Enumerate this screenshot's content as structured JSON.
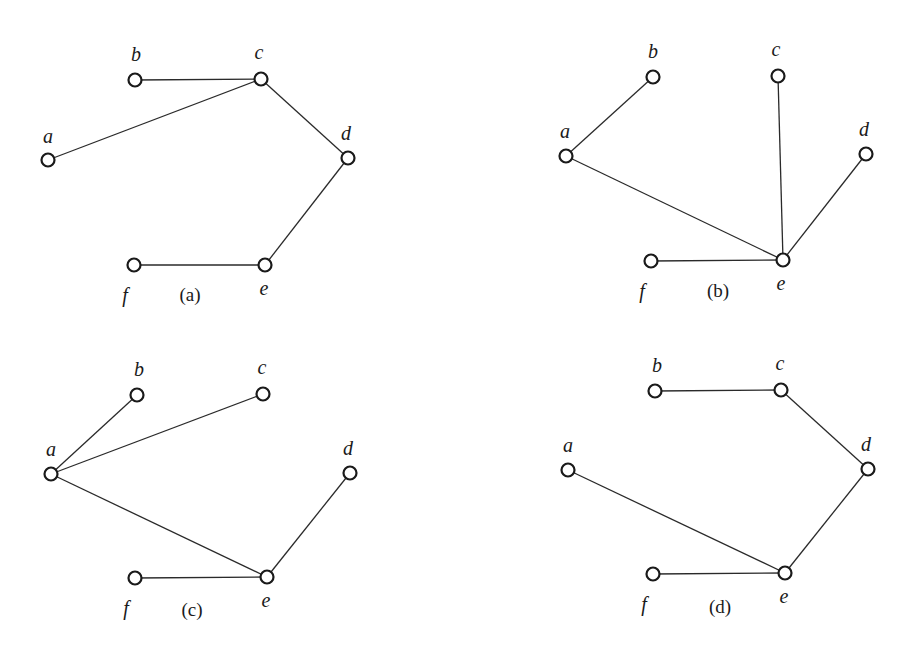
{
  "diagram": {
    "node_color": "#1a1a1a",
    "edge_color": "#2a2a2a",
    "background": "#ffffff",
    "panels": [
      {
        "caption": "(a)",
        "caption_pos": [
          190,
          301
        ],
        "nodes": [
          {
            "id": "a",
            "label": "a",
            "x": 48,
            "y": 160,
            "lx": 48,
            "ly": 143
          },
          {
            "id": "b",
            "label": "b",
            "x": 135,
            "y": 80,
            "lx": 136,
            "ly": 61
          },
          {
            "id": "c",
            "label": "c",
            "x": 261,
            "y": 79,
            "lx": 259,
            "ly": 59
          },
          {
            "id": "d",
            "label": "d",
            "x": 348,
            "y": 158,
            "lx": 346,
            "ly": 140
          },
          {
            "id": "e",
            "label": "e",
            "x": 265,
            "y": 265,
            "lx": 264,
            "ly": 295
          },
          {
            "id": "f",
            "label": "f",
            "x": 134,
            "y": 265,
            "lx": 125,
            "ly": 302
          }
        ],
        "edges": [
          [
            "b",
            "c"
          ],
          [
            "a",
            "c"
          ],
          [
            "c",
            "d"
          ],
          [
            "d",
            "e"
          ],
          [
            "f",
            "e"
          ]
        ]
      },
      {
        "caption": "(b)",
        "caption_pos": [
          718,
          297
        ],
        "nodes": [
          {
            "id": "a",
            "label": "a",
            "x": 566,
            "y": 156,
            "lx": 565,
            "ly": 138
          },
          {
            "id": "b",
            "label": "b",
            "x": 653,
            "y": 77,
            "lx": 653,
            "ly": 58
          },
          {
            "id": "c",
            "label": "c",
            "x": 778,
            "y": 76,
            "lx": 776,
            "ly": 56
          },
          {
            "id": "d",
            "label": "d",
            "x": 866,
            "y": 154,
            "lx": 864,
            "ly": 136
          },
          {
            "id": "e",
            "label": "e",
            "x": 783,
            "y": 260,
            "lx": 781,
            "ly": 290
          },
          {
            "id": "f",
            "label": "f",
            "x": 651,
            "y": 261,
            "lx": 642,
            "ly": 298
          }
        ],
        "edges": [
          [
            "a",
            "b"
          ],
          [
            "a",
            "e"
          ],
          [
            "c",
            "e"
          ],
          [
            "d",
            "e"
          ],
          [
            "f",
            "e"
          ]
        ]
      },
      {
        "caption": "(c)",
        "caption_pos": [
          192,
          616
        ],
        "nodes": [
          {
            "id": "a",
            "label": "a",
            "x": 51,
            "y": 474,
            "lx": 51,
            "ly": 456
          },
          {
            "id": "b",
            "label": "b",
            "x": 137,
            "y": 395,
            "lx": 139,
            "ly": 376
          },
          {
            "id": "c",
            "label": "c",
            "x": 263,
            "y": 394,
            "lx": 262,
            "ly": 374
          },
          {
            "id": "d",
            "label": "d",
            "x": 350,
            "y": 473,
            "lx": 348,
            "ly": 455
          },
          {
            "id": "e",
            "label": "e",
            "x": 267,
            "y": 577,
            "lx": 266,
            "ly": 607
          },
          {
            "id": "f",
            "label": "f",
            "x": 135,
            "y": 578,
            "lx": 126,
            "ly": 615
          }
        ],
        "edges": [
          [
            "a",
            "b"
          ],
          [
            "a",
            "c"
          ],
          [
            "a",
            "e"
          ],
          [
            "d",
            "e"
          ],
          [
            "f",
            "e"
          ]
        ]
      },
      {
        "caption": "(d)",
        "caption_pos": [
          720,
          613
        ],
        "nodes": [
          {
            "id": "a",
            "label": "a",
            "x": 568,
            "y": 470,
            "lx": 568,
            "ly": 452
          },
          {
            "id": "b",
            "label": "b",
            "x": 655,
            "y": 391,
            "lx": 657,
            "ly": 372
          },
          {
            "id": "c",
            "label": "c",
            "x": 781,
            "y": 390,
            "lx": 780,
            "ly": 370
          },
          {
            "id": "d",
            "label": "d",
            "x": 868,
            "y": 469,
            "lx": 866,
            "ly": 451
          },
          {
            "id": "e",
            "label": "e",
            "x": 785,
            "y": 573,
            "lx": 784,
            "ly": 603
          },
          {
            "id": "f",
            "label": "f",
            "x": 653,
            "y": 574,
            "lx": 644,
            "ly": 611
          }
        ],
        "edges": [
          [
            "b",
            "c"
          ],
          [
            "c",
            "d"
          ],
          [
            "d",
            "e"
          ],
          [
            "a",
            "e"
          ],
          [
            "f",
            "e"
          ]
        ]
      }
    ]
  }
}
